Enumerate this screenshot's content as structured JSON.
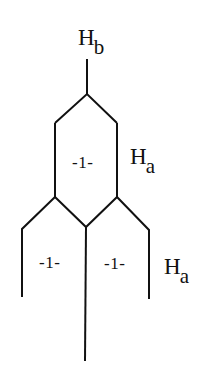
{
  "diagram": {
    "type": "structural-formula",
    "stroke_color": "#111111",
    "background": "#ffffff",
    "atom_labels": [
      {
        "id": "hb",
        "main": "H",
        "sub": "b"
      },
      {
        "id": "ha_upper",
        "main": "H",
        "sub": "a"
      },
      {
        "id": "ha_lower",
        "main": "H",
        "sub": "a"
      }
    ],
    "ring_labels": [
      {
        "id": "ring_top",
        "text": "-1-"
      },
      {
        "id": "ring_bottom_left",
        "text": "-1-"
      },
      {
        "id": "ring_bottom_right",
        "text": "-1-"
      }
    ]
  }
}
